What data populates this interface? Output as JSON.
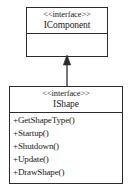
{
  "diagram": {
    "type": "uml-class-diagram",
    "background_color": "#ffffff",
    "line_color": "#2b2b2b"
  },
  "interfaces": [
    {
      "id": "icomponent",
      "stereotype": "<<interface>>",
      "name": "IComponent",
      "operations": []
    },
    {
      "id": "ishape",
      "stereotype": "<<interface>>",
      "name": "IShape",
      "operations": [
        "+GetShapeType()",
        "+Startup()",
        "+Shutdown()",
        "+Update()",
        "+DrawShape()"
      ]
    }
  ],
  "relationships": [
    {
      "kind": "generalization",
      "source": "IShape",
      "target": "IComponent",
      "arrowhead": "filled-triangle",
      "line_style": "solid"
    }
  ]
}
